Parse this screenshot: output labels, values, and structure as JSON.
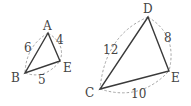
{
  "figure": {
    "triangles": [
      {
        "name": "triangle-abe",
        "vertices": [
          "A",
          "B",
          "E"
        ],
        "sides": [
          {
            "between": [
              "A",
              "B"
            ],
            "length": "6"
          },
          {
            "between": [
              "A",
              "E"
            ],
            "length": "4"
          },
          {
            "between": [
              "B",
              "E"
            ],
            "length": "5"
          }
        ]
      },
      {
        "name": "triangle-cde",
        "vertices": [
          "D",
          "C",
          "E"
        ],
        "sides": [
          {
            "between": [
              "C",
              "D"
            ],
            "length": "12"
          },
          {
            "between": [
              "D",
              "E"
            ],
            "length": "8"
          },
          {
            "between": [
              "C",
              "E"
            ],
            "length": "10"
          }
        ]
      }
    ],
    "colors": {
      "edge": "#3a3a3a",
      "arc": "#9a9a9a",
      "text": "#444444"
    }
  }
}
